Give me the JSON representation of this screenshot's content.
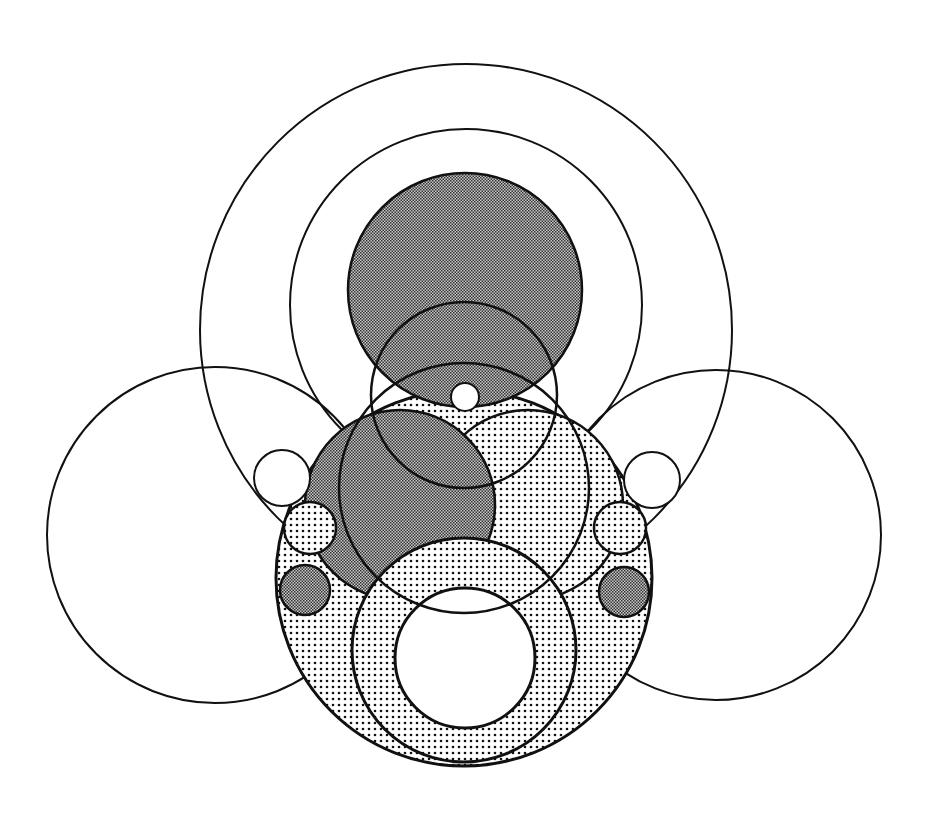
{
  "diagram": {
    "title": "",
    "background": "#ffffff",
    "stroke": "#111111",
    "fills": {
      "dark": "#8a8a8a",
      "dotted_bg": "#ffffff",
      "dotted_dot": "#111111",
      "none": "none"
    },
    "circles": [
      {
        "id": "outer-large",
        "cx": 466,
        "cy": 330,
        "r": 266,
        "fill": "none",
        "sw": 2
      },
      {
        "id": "outer-second",
        "cx": 466,
        "cy": 305,
        "r": 176,
        "fill": "none",
        "sw": 2
      },
      {
        "id": "left-large",
        "cx": 215,
        "cy": 535,
        "r": 168,
        "fill": "none",
        "sw": 2
      },
      {
        "id": "right-large",
        "cx": 716,
        "cy": 535,
        "r": 165,
        "fill": "none",
        "sw": 2
      },
      {
        "id": "middle-main",
        "cx": 464,
        "cy": 578,
        "r": 188,
        "fill": "dotted",
        "sw": 3
      },
      {
        "id": "right-lens",
        "cx": 528,
        "cy": 505,
        "r": 95,
        "fill": "dotted",
        "sw": 2.5
      },
      {
        "id": "left-lens",
        "cx": 400,
        "cy": 505,
        "r": 95,
        "fill": "dark",
        "sw": 2.5
      },
      {
        "id": "top-filled",
        "cx": 465,
        "cy": 290,
        "r": 117,
        "fill": "dark",
        "sw": 2.5
      },
      {
        "id": "bottom-ring-outer",
        "cx": 464,
        "cy": 650,
        "r": 112,
        "fill": "dotted",
        "sw": 3
      },
      {
        "id": "bottom-ring-hole",
        "cx": 465,
        "cy": 658,
        "r": 70,
        "fill": "white",
        "sw": 3
      },
      {
        "id": "top-small",
        "cx": 465,
        "cy": 397,
        "r": 14,
        "fill": "white",
        "sw": 2
      },
      {
        "id": "left-small-empty",
        "cx": 282,
        "cy": 478,
        "r": 28,
        "fill": "white",
        "sw": 2
      },
      {
        "id": "left-small-dotted",
        "cx": 310,
        "cy": 528,
        "r": 26,
        "fill": "dotted",
        "sw": 2.5
      },
      {
        "id": "left-small-dark",
        "cx": 305,
        "cy": 590,
        "r": 25,
        "fill": "dark",
        "sw": 2.5
      },
      {
        "id": "right-small-empty",
        "cx": 652,
        "cy": 480,
        "r": 28,
        "fill": "white",
        "sw": 2
      },
      {
        "id": "right-small-dotted",
        "cx": 620,
        "cy": 528,
        "r": 26,
        "fill": "dotted",
        "sw": 2.5
      },
      {
        "id": "right-small-dark",
        "cx": 624,
        "cy": 592,
        "r": 25,
        "fill": "dark",
        "sw": 2.5
      }
    ],
    "arcs": [
      {
        "id": "bottom-lens-arc",
        "cx": 464,
        "cy": 488,
        "r": 125,
        "sw": 2.5
      },
      {
        "id": "upper-cross-arc",
        "cx": 464,
        "cy": 395,
        "r": 93,
        "sw": 2.5
      }
    ]
  }
}
